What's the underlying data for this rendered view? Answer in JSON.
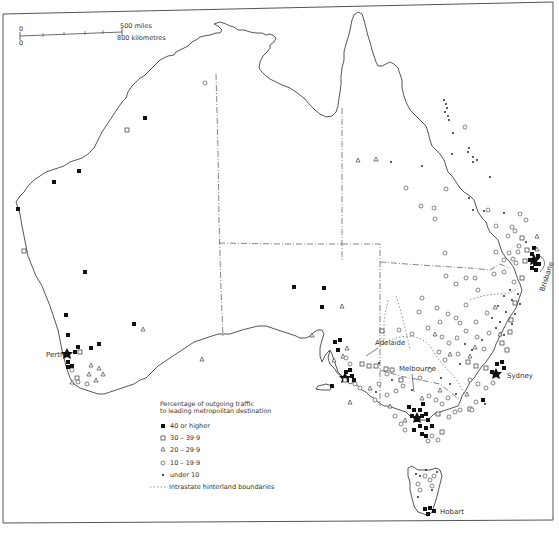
{
  "scale": {
    "zero_top": "0",
    "zero_bottom": "0",
    "miles_label": "500 miles",
    "km_label": "800 kilometres"
  },
  "cities": {
    "perth": "Perth",
    "adelaide": "Adelaide",
    "melbourne": "Melbourne",
    "sydney": "Sydney",
    "brisbane": "Brisbane",
    "hobart": "Hobart"
  },
  "legend": {
    "title_line1": "Percentage  of  outgoing  traffic",
    "title_line2": "to leading metropolitan destination",
    "items": [
      {
        "symbol": "filled-square",
        "label": "40  or  higher"
      },
      {
        "symbol": "open-square",
        "label": "30  –  39·9"
      },
      {
        "symbol": "triangle",
        "label": "20  –  29·9"
      },
      {
        "symbol": "circle",
        "label": "10  –  19·9"
      },
      {
        "symbol": "dot",
        "label": "under 10"
      },
      {
        "symbol": "dotted-line",
        "label": "Intrastate hinterland boundaries"
      }
    ]
  },
  "colors": {
    "ink": "#111111",
    "paper": "#ffffff",
    "outline": "#444444"
  }
}
